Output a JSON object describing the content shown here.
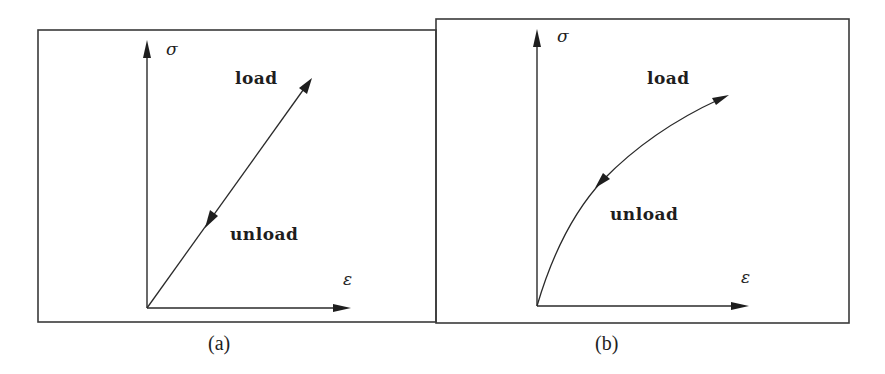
{
  "figure": {
    "panels": [
      {
        "id": "a",
        "caption": "(a)",
        "y_axis_label": "σ",
        "x_axis_label": "ε",
        "load_label": "load",
        "unload_label": "unload",
        "curve_type": "linear"
      },
      {
        "id": "b",
        "caption": "(b)",
        "y_axis_label": "σ",
        "x_axis_label": "ε",
        "load_label": "load",
        "unload_label": "unload",
        "curve_type": "nonlinear-concave"
      }
    ]
  },
  "colors": {
    "ink": "#1e1e1e",
    "frame": "#3a3a3a",
    "background": "#ffffff"
  }
}
